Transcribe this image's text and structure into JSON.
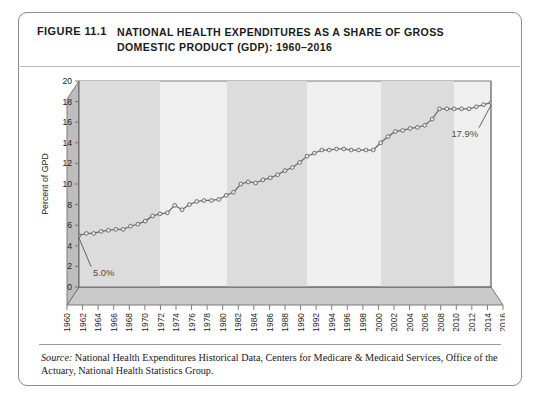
{
  "figure": {
    "number": "FIGURE 11.1",
    "title": "NATIONAL HEALTH EXPENDITURES AS A SHARE OF GROSS DOMESTIC PRODUCT (GDP): 1960–2016",
    "source_label": "Source:",
    "source_text": " National Health Expenditures Historical Data, Centers for Medicare & Medicaid Services, Office of the Actuary, National Health Statistics Group."
  },
  "colors": {
    "line": "#6b6b6b",
    "marker_fill": "#e9e9e9",
    "marker_stroke": "#5d5d5d",
    "band": "#dcdcdc",
    "plot_bg": "#efefef",
    "wall": "#bdbdbd",
    "floor": "#c9c9c9",
    "frame": "#6f6f6f",
    "card_border": "#8d8d8d",
    "text": "#1b1b1b",
    "annotation": "#4b4b4b"
  },
  "chart_data": {
    "type": "line",
    "title": "National Health Expenditures as a Share of Gross Domestic Product (GDP): 1960–2016",
    "xlabel": "",
    "ylabel": "Percent of GPD",
    "ylim": [
      0,
      20
    ],
    "ytick_step": 2,
    "yticks": [
      0,
      2,
      4,
      6,
      8,
      10,
      12,
      14,
      16,
      18,
      20
    ],
    "xlim": [
      1960,
      2016
    ],
    "xticks": [
      1960,
      1962,
      1964,
      1966,
      1968,
      1970,
      1972,
      1974,
      1976,
      1978,
      1980,
      1982,
      1984,
      1986,
      1988,
      1990,
      1992,
      1994,
      1996,
      1998,
      2000,
      2002,
      2004,
      2006,
      2008,
      2010,
      2012,
      2014,
      2016
    ],
    "grid": false,
    "legend": null,
    "marker": "circle",
    "x": [
      1960,
      1961,
      1962,
      1963,
      1964,
      1965,
      1966,
      1967,
      1968,
      1969,
      1970,
      1971,
      1972,
      1973,
      1974,
      1975,
      1976,
      1977,
      1978,
      1979,
      1980,
      1981,
      1982,
      1983,
      1984,
      1985,
      1986,
      1987,
      1988,
      1989,
      1990,
      1991,
      1992,
      1993,
      1994,
      1995,
      1996,
      1997,
      1998,
      1999,
      2000,
      2001,
      2002,
      2003,
      2004,
      2005,
      2006,
      2007,
      2008,
      2009,
      2010,
      2011,
      2012,
      2013,
      2014,
      2015,
      2016
    ],
    "values": [
      5.0,
      5.2,
      5.2,
      5.4,
      5.5,
      5.6,
      5.6,
      5.9,
      6.1,
      6.4,
      6.9,
      7.1,
      7.2,
      7.930000000000001,
      7.5,
      8.0,
      8.3,
      8.4,
      8.4,
      8.5,
      8.9,
      9.2,
      10.0,
      10.2,
      10.1,
      10.4,
      10.6,
      10.9,
      11.3,
      11.6,
      12.1,
      12.7,
      13.0,
      13.3,
      13.3,
      13.4,
      13.4,
      13.3,
      13.3,
      13.3,
      13.3,
      14.0,
      14.6,
      15.1,
      15.2,
      15.4,
      15.5,
      15.7,
      16.3,
      17.3,
      17.3,
      17.3,
      17.3,
      17.3,
      17.5,
      17.7,
      17.9
    ],
    "annotations": [
      {
        "label": "5.0%",
        "year": 1960,
        "value": 5.0
      },
      {
        "label": "17.9%",
        "year": 2016,
        "value": 17.9
      }
    ],
    "shaded_bands": [
      {
        "from": 1960,
        "to": 1971
      },
      {
        "from": 1980,
        "to": 1991
      },
      {
        "from": 2001,
        "to": 2011
      }
    ]
  }
}
